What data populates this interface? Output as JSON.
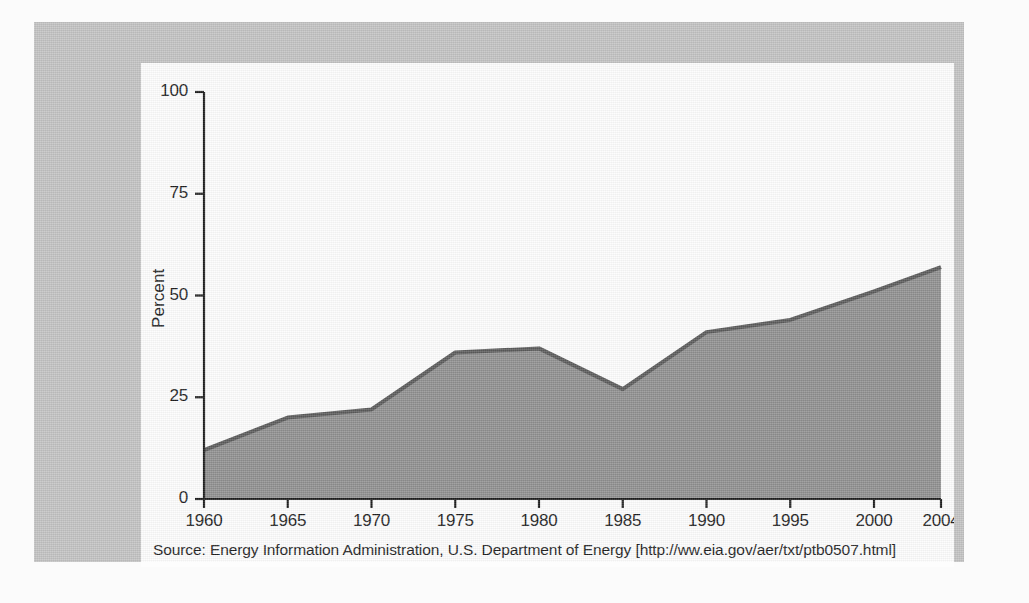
{
  "figure": {
    "panel_background": "#fdfdfd",
    "frame_color": "#c2c2c2",
    "page_background": "#fbfbfb"
  },
  "source": {
    "text": "Source: Energy Information Administration, U.S. Department of Energy [http://ww.eia.gov/aer/txt/ptb0507.html]"
  },
  "chart_data": {
    "type": "area",
    "title": "",
    "subtitle": "",
    "xlabel": "",
    "ylabel": "Percent",
    "x": [
      1960,
      1965,
      1970,
      1975,
      1980,
      1985,
      1990,
      1995,
      2000,
      2004
    ],
    "categories": [
      "1960",
      "1965",
      "1970",
      "1975",
      "1980",
      "1985",
      "1990",
      "1995",
      "2000",
      "2004"
    ],
    "values": [
      12,
      20,
      22,
      36,
      37,
      27,
      41,
      44,
      51,
      57
    ],
    "series": [
      {
        "name": "Percent",
        "values": [
          12,
          20,
          22,
          36,
          37,
          27,
          41,
          44,
          51,
          57
        ]
      }
    ],
    "xlim": [
      1960,
      2004
    ],
    "ylim": [
      0,
      100
    ],
    "yticks": [
      0,
      25,
      50,
      75,
      100
    ],
    "ytick_labels": [
      "0",
      "25",
      "50",
      "75",
      "100"
    ],
    "xticks": [
      1960,
      1965,
      1970,
      1975,
      1980,
      1985,
      1990,
      1995,
      2000,
      2004
    ],
    "xtick_labels": [
      "1960",
      "1965",
      "1970",
      "1975",
      "1980",
      "1985",
      "1990",
      "1995",
      "2000",
      "2004"
    ],
    "grid": false,
    "legend": false,
    "legend_position": "none",
    "fill_color": "#8f8f8f",
    "line_color": "#5a5a5a",
    "axis_color": "#1c1c1c",
    "annotations": []
  }
}
